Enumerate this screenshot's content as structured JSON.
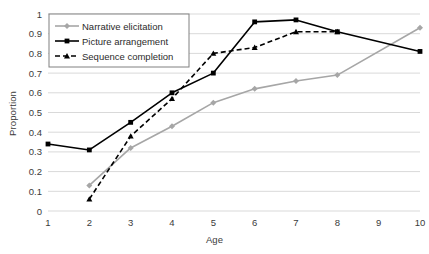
{
  "chart_data": {
    "type": "line",
    "title": "",
    "xlabel": "Age",
    "ylabel": "Proportion",
    "x": [
      1,
      2,
      3,
      4,
      5,
      6,
      7,
      8,
      9,
      10
    ],
    "xticklabels": [
      "1",
      "2",
      "3",
      "4",
      "5",
      "6",
      "7",
      "8",
      "9",
      "10"
    ],
    "yticklabels": [
      "0",
      "0.1",
      "0.2",
      "0.3",
      "0.4",
      "0.5",
      "0.6",
      "0.7",
      "0.8",
      "0.9",
      "1"
    ],
    "ytickvalues": [
      0,
      0.1,
      0.2,
      0.3,
      0.4,
      0.5,
      0.6,
      0.7,
      0.8,
      0.9,
      1
    ],
    "xlim": [
      1,
      10
    ],
    "ylim": [
      0,
      1
    ],
    "grid": "horizontal",
    "legend_position": "upper-left-inside",
    "series": [
      {
        "name": "Narrative elicitation",
        "color": "#a6a6a6",
        "style": "solid",
        "marker": "diamond",
        "x": [
          2,
          3,
          4,
          5,
          6,
          7,
          8,
          10
        ],
        "values": [
          0.13,
          0.32,
          0.43,
          0.55,
          0.62,
          0.66,
          0.69,
          0.93
        ]
      },
      {
        "name": "Picture arrangement",
        "color": "#000000",
        "style": "solid",
        "marker": "square",
        "x": [
          1,
          2,
          3,
          4,
          5,
          6,
          7,
          8,
          10
        ],
        "values": [
          0.34,
          0.31,
          0.45,
          0.6,
          0.7,
          0.96,
          0.97,
          0.91,
          0.81
        ]
      },
      {
        "name": "Sequence completion",
        "color": "#000000",
        "style": "dashed",
        "marker": "triangle",
        "x": [
          2,
          3,
          4,
          5,
          6,
          7,
          8
        ],
        "values": [
          0.06,
          0.38,
          0.57,
          0.8,
          0.83,
          0.91,
          0.91
        ]
      }
    ]
  }
}
